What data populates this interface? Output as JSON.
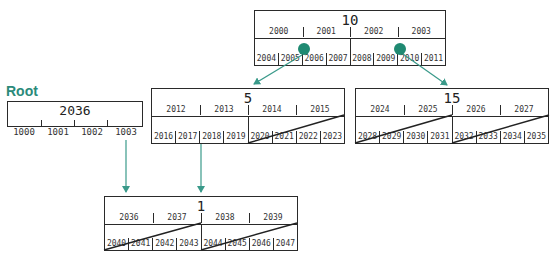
{
  "root_label": "Root",
  "root": {
    "number": "2036",
    "keys": [
      "1000",
      "1001",
      "1002",
      "1003"
    ]
  },
  "nodes": {
    "n10": {
      "number": "10",
      "keys": [
        "2000",
        "2001",
        "2002",
        "2003"
      ],
      "leaves": [
        "2004",
        "2005",
        "2006",
        "2007",
        "2008",
        "2009",
        "2010",
        "2011"
      ]
    },
    "n5": {
      "number": "5",
      "keys": [
        "2012",
        "2013",
        "2014",
        "2015"
      ],
      "leaves": [
        "2016",
        "2017",
        "2018",
        "2019",
        "2020",
        "2021",
        "2022",
        "2023"
      ]
    },
    "n15": {
      "number": "15",
      "keys": [
        "2024",
        "2025",
        "2026",
        "2027"
      ],
      "leaves": [
        "2028",
        "2029",
        "2030",
        "2031",
        "2032",
        "2033",
        "2034",
        "2035"
      ]
    },
    "n1": {
      "number": "1",
      "keys": [
        "2036",
        "2037",
        "2038",
        "2039"
      ],
      "leaves": [
        "2040",
        "2041",
        "2042",
        "2043",
        "2044",
        "2045",
        "2046",
        "2047"
      ]
    }
  },
  "colors": {
    "accent": "#2a8a7a",
    "line": "#2a2a2a",
    "dot": "#1f8a72"
  }
}
